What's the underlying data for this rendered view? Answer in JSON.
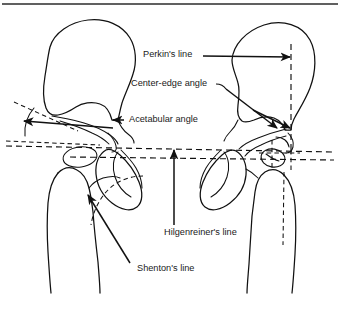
{
  "figure": {
    "background_color": "#ffffff",
    "ink_color": "#111111",
    "width": 340,
    "height": 314,
    "top_rule": true
  },
  "labels": {
    "perkins_line": "Perkin's line",
    "center_edge_angle": "Center-edge angle",
    "acetabular_angle": "Acetabular angle",
    "hilgenreiners_line": "Hilgenreiner's line",
    "shentons_line": "Shenton's line"
  },
  "annotations": [
    {
      "id": "perkins-line",
      "label": "Perkin's line",
      "text_x": 143,
      "text_y": 54,
      "leader": "horizontal arrow pointing right to vertical dashed line over right hip",
      "target": "vertical dashed line through lateral edge of right acetabulum"
    },
    {
      "id": "center-edge-angle",
      "label": "Center-edge angle",
      "text_x": 131,
      "text_y": 84,
      "leader": "short hook then long arrow down-right",
      "target": "apex at right acetabular edge between vertical line and line to femoral head center"
    },
    {
      "id": "acetabular-angle",
      "label": "Acetabular angle",
      "text_x": 128,
      "text_y": 122,
      "leader": "horizontal arrow pointing left to left acetabular roof",
      "target": "angle between Hilgenreiner's line and the acetabular roof on the left hip"
    },
    {
      "id": "hilgenreiners-line",
      "label": "Hilgenreiner's line",
      "text_x": 164,
      "text_y": 233,
      "leader": "vertical arrow pointing up",
      "target": "horizontal dashed line through triradiate cartilages"
    },
    {
      "id": "shentons-line",
      "label": "Shenton's line",
      "text_x": 137,
      "text_y": 269,
      "leader": "diagonal arrow pointing up-left",
      "target": "dashed arc along inferior femoral neck and superior obturator foramen"
    }
  ],
  "anatomy": {
    "structures": [
      "left iliac wing",
      "right iliac wing",
      "left acetabulum",
      "right acetabulum",
      "left obturator foramen",
      "right obturator foramen",
      "left ossific nucleus of femoral head",
      "right ossific nucleus of femoral head",
      "left proximal femur",
      "right proximal femur"
    ]
  },
  "reference_lines": [
    {
      "name": "Hilgenreiner's line",
      "style": "dashed",
      "orientation": "horizontal"
    },
    {
      "name": "pelvic reference line",
      "style": "dashed",
      "orientation": "horizontal"
    },
    {
      "name": "Perkin's line (right)",
      "style": "dashed",
      "orientation": "vertical"
    },
    {
      "name": "Shenton's line",
      "style": "dashed",
      "orientation": "arc"
    }
  ]
}
